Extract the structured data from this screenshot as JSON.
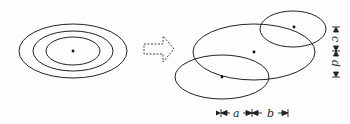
{
  "diagram": {
    "stroke_color": "#222222",
    "left_group": {
      "description": "concentric ellipses around a single center",
      "center": [
        73,
        51
      ],
      "ellipses": [
        {
          "rx": 54,
          "ry": 27
        },
        {
          "rx": 40,
          "ry": 20
        },
        {
          "rx": 27,
          "ry": 14
        }
      ]
    },
    "arrow": {
      "style": "dashed-outline",
      "direction": "right"
    },
    "right_group": {
      "description": "three overlapping ellipses with offset centers",
      "ellipses": [
        {
          "name": "center-ellipse",
          "cx": 254,
          "cy": 52,
          "rx": 61,
          "ry": 28
        },
        {
          "name": "upper-right-ellipse",
          "cx": 293,
          "cy": 29,
          "rx": 33,
          "ry": 18
        },
        {
          "name": "lower-left-ellipse",
          "cx": 222,
          "cy": 77,
          "rx": 47,
          "ry": 22
        }
      ]
    },
    "dimension_labels": {
      "a": "a",
      "b": "b",
      "c": "c",
      "d": "d"
    }
  }
}
